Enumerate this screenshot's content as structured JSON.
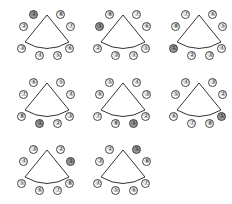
{
  "diagram": {
    "highlight_color": "#9a9a9a",
    "highlighted_seat": "1",
    "panels": [
      {
        "id": "p1",
        "left": 0,
        "top": 0,
        "seats": [
          "1",
          "2",
          "3",
          "4",
          "5",
          "6",
          "7",
          "8"
        ],
        "labels": {
          "s0": "①",
          "s1": "②",
          "s2": "③",
          "s3": "④",
          "s4": "⑤",
          "s5": "⑥",
          "s6": "⑦",
          "s7": "⑧"
        },
        "order_clockwise_from_top_left": [
          "1",
          "8",
          "7",
          "6",
          "5",
          "4",
          "3",
          "2"
        ]
      },
      {
        "id": "p2",
        "left": 76,
        "top": 0,
        "order_clockwise_from_top_left": [
          "8",
          "7",
          "6",
          "5",
          "4",
          "3",
          "2",
          "1"
        ]
      },
      {
        "id": "p3",
        "left": 152,
        "top": 0,
        "order_clockwise_from_top_left": [
          "7",
          "6",
          "5",
          "4",
          "3",
          "2",
          "1",
          "8"
        ]
      },
      {
        "id": "p4",
        "left": 0,
        "top": 68,
        "order_clockwise_from_top_left": [
          "6",
          "5",
          "4",
          "3",
          "2",
          "1",
          "8",
          "7"
        ]
      },
      {
        "id": "p5",
        "left": 76,
        "top": 68,
        "order_clockwise_from_top_left": [
          "5",
          "4",
          "3",
          "2",
          "1",
          "8",
          "7",
          "6"
        ]
      },
      {
        "id": "p6",
        "left": 152,
        "top": 68,
        "order_clockwise_from_top_left": [
          "4",
          "3",
          "2",
          "1",
          "8",
          "7",
          "6",
          "5"
        ]
      },
      {
        "id": "p7",
        "left": 0,
        "top": 135,
        "order_clockwise_from_top_left": [
          "3",
          "2",
          "1",
          "8",
          "7",
          "6",
          "5",
          "4"
        ]
      },
      {
        "id": "p8",
        "left": 76,
        "top": 135,
        "order_clockwise_from_top_left": [
          "2",
          "1",
          "8",
          "7",
          "6",
          "5",
          "4",
          "3"
        ]
      }
    ]
  },
  "seat_glyphs": {
    "1": "①",
    "2": "②",
    "3": "③",
    "4": "④",
    "5": "⑤",
    "6": "⑥",
    "7": "⑦",
    "8": "⑧"
  },
  "p": [
    [
      "①",
      "⑧",
      "⑦",
      "⑥",
      "⑤",
      "④",
      "③",
      "②"
    ],
    [
      "⑧",
      "⑦",
      "⑥",
      "⑤",
      "④",
      "③",
      "②",
      "①"
    ],
    [
      "⑦",
      "⑥",
      "⑤",
      "④",
      "③",
      "②",
      "①",
      "⑧"
    ],
    [
      "⑥",
      "⑤",
      "④",
      "③",
      "②",
      "①",
      "⑧",
      "⑦"
    ],
    [
      "⑤",
      "④",
      "③",
      "②",
      "①",
      "⑧",
      "⑦",
      "⑥"
    ],
    [
      "④",
      "③",
      "②",
      "①",
      "⑧",
      "⑦",
      "⑥",
      "⑤"
    ],
    [
      "③",
      "②",
      "①",
      "⑧",
      "⑦",
      "⑥",
      "⑤",
      "④"
    ],
    [
      "②",
      "①",
      "⑧",
      "⑦",
      "⑥",
      "⑤",
      "④",
      "③"
    ]
  ]
}
